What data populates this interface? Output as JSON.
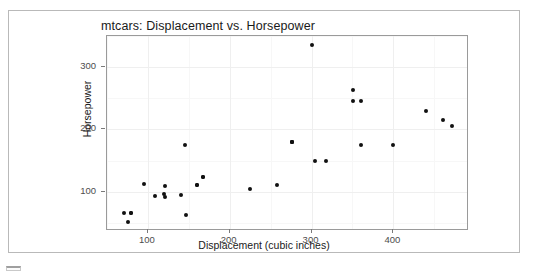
{
  "chart_data": {
    "type": "scatter",
    "title": "mtcars: Displacement vs. Horsepower",
    "xlabel": "Displacement (cubic inches)",
    "ylabel": "Horsepower",
    "xlim": [
      50,
      490
    ],
    "ylim": [
      40,
      350
    ],
    "xticks": [
      100,
      200,
      300,
      400
    ],
    "yticks": [
      100,
      200,
      300
    ],
    "grid": true,
    "legend": "none",
    "point_color": "#111111",
    "panel_background": "#ffffff",
    "gridline_color": "#efefef",
    "x": [
      160,
      160,
      108,
      258,
      360,
      225,
      360,
      146.7,
      140.8,
      167.6,
      167.6,
      275.8,
      275.8,
      275.8,
      472,
      460,
      440,
      78.7,
      75.7,
      71.1,
      120.1,
      318,
      304,
      350,
      400,
      79,
      120.3,
      95.1,
      351,
      145,
      301,
      121
    ],
    "y": [
      110,
      110,
      93,
      110,
      175,
      105,
      245,
      62,
      95,
      123,
      123,
      180,
      180,
      180,
      205,
      215,
      230,
      66,
      52,
      65,
      97,
      150,
      150,
      245,
      175,
      66,
      91,
      113,
      264,
      175,
      335,
      109
    ]
  },
  "corner": {
    "mark": "partial-ui-element"
  }
}
